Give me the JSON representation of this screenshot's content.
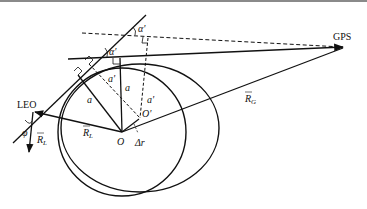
{
  "diagram": {
    "title": "",
    "colors": {
      "stroke": "#111111",
      "background": "#ffffff",
      "top_bar": "#8a8a8a"
    },
    "labels": {
      "gps": "GPS",
      "leo": "LEO",
      "origin": "O",
      "origin_prime": "O'",
      "r_g": "R",
      "r_g_sub": "G",
      "r_l_center": "R",
      "r_l_center_sub": "L",
      "r_l_side": "R",
      "r_l_side_sub": "L",
      "delta_r": "Δr",
      "phi": "φ",
      "alpha_prime_upper": "α'",
      "alpha_prime_middle": "α'",
      "a_prime_dashed": "a'",
      "a_prime_vertical": "a'",
      "a_left": "a",
      "a_vertical": "a"
    },
    "nodes": {
      "gps": [
        345,
        47
      ],
      "leo": [
        33,
        112
      ],
      "O": [
        122,
        132
      ],
      "O_prime": [
        140,
        118
      ]
    }
  }
}
